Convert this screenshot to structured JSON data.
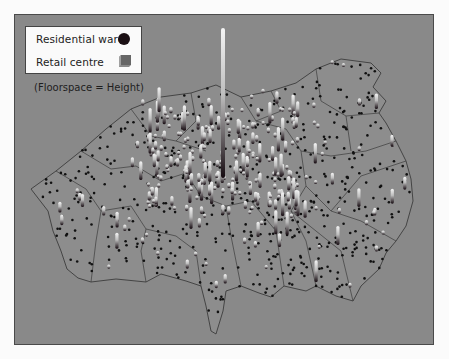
{
  "legend": {
    "items": [
      {
        "label": "Residential ward",
        "symbol": "dark-circle",
        "color": "#1a0f14"
      },
      {
        "label": "Retail centre",
        "symbol": "grey-cube",
        "color": "#6e6e6e"
      }
    ],
    "note": "(Floorspace = Height)"
  },
  "colors": {
    "background": "#898989",
    "boundary": "#3c3c3c",
    "ward_dot": "#111111",
    "retail_top": "#f2f2f2"
  }
}
